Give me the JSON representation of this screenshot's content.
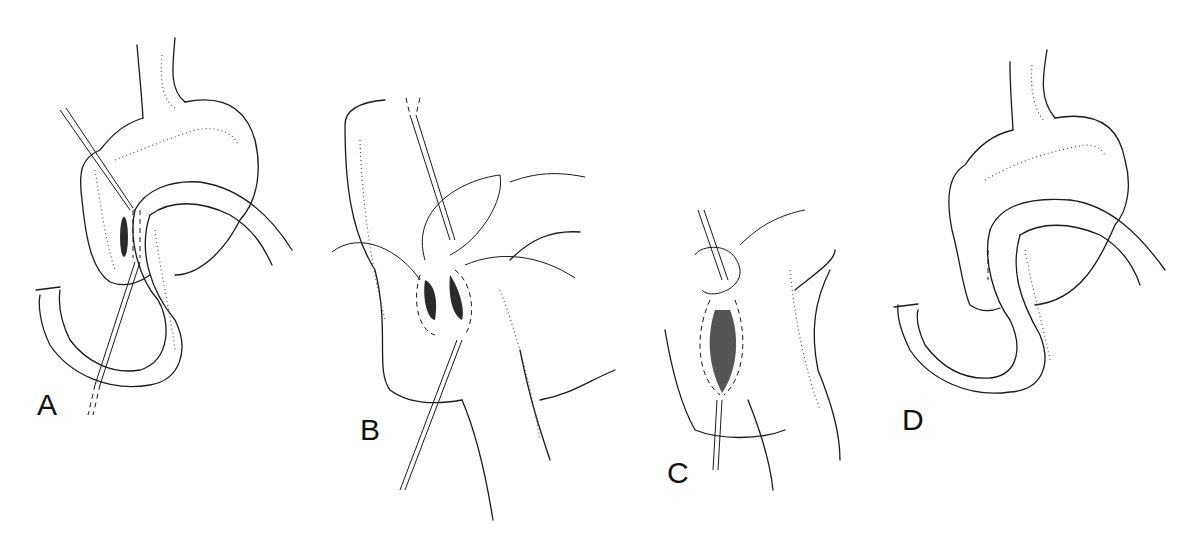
{
  "figure": {
    "panels": [
      {
        "id": "A",
        "label": "A"
      },
      {
        "id": "B",
        "label": "B"
      },
      {
        "id": "C",
        "label": "C"
      },
      {
        "id": "D",
        "label": "D"
      }
    ],
    "colors": {
      "ink": "#1a1a1a",
      "background": "#ffffff",
      "stipple": "#555555"
    }
  }
}
